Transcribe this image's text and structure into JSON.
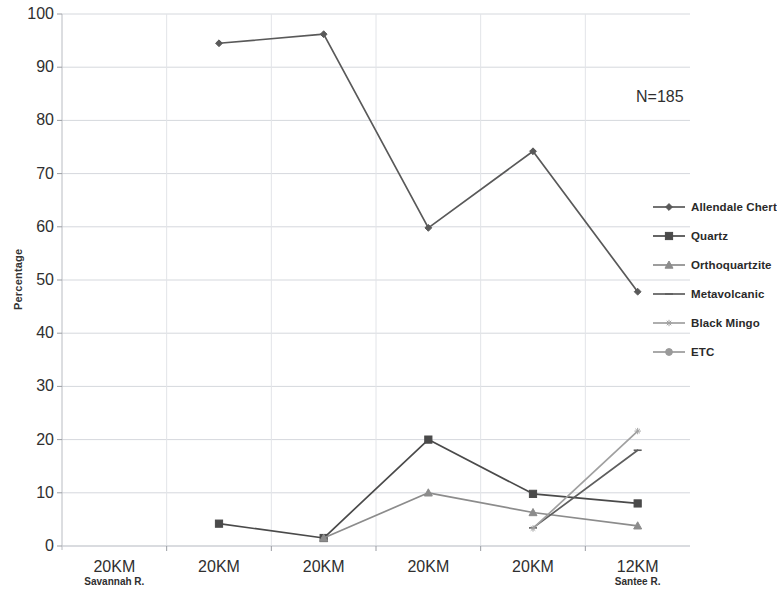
{
  "chart_data": {
    "type": "line",
    "title": "",
    "xlabel": "",
    "ylabel": "Percentage",
    "ylim": [
      0,
      100
    ],
    "ytick_step": 10,
    "yticks": [
      "100",
      "90",
      "80",
      "70",
      "60",
      "50",
      "40",
      "30",
      "20",
      "10",
      "0"
    ],
    "grid": true,
    "legend_position": "right",
    "annotation": "N=185",
    "categories": [
      "20KM",
      "20KM",
      "20KM",
      "20KM",
      "20KM",
      "12KM"
    ],
    "category_sublabels": [
      "Savannah R.",
      "",
      "",
      "",
      "",
      "Santee R."
    ],
    "series": [
      {
        "name": "Allendale Chert",
        "marker": "diamond",
        "color": "#595959",
        "values": [
          null,
          94.5,
          96.2,
          59.8,
          74.2,
          47.8
        ]
      },
      {
        "name": "Quartz",
        "marker": "square",
        "color": "#4a4a4a",
        "values": [
          null,
          4.2,
          1.5,
          20.0,
          9.8,
          8.0
        ]
      },
      {
        "name": "Orthoquartzite",
        "marker": "triangle",
        "color": "#8c8c8c",
        "values": [
          null,
          null,
          1.5,
          10.0,
          6.3,
          3.8
        ]
      },
      {
        "name": "Metavolcanic",
        "marker": "dash",
        "color": "#5e5e5e",
        "values": [
          null,
          null,
          null,
          null,
          3.4,
          18.0
        ]
      },
      {
        "name": "Black Mingo",
        "marker": "asterisk",
        "color": "#a0a0a0",
        "values": [
          null,
          null,
          null,
          null,
          3.3,
          21.6
        ]
      },
      {
        "name": "ETC",
        "marker": "circle",
        "color": "#9a9a9a",
        "values": [
          null,
          null,
          null,
          null,
          null,
          null
        ]
      }
    ]
  },
  "legend": {
    "items": [
      {
        "label": "Allendale Chert"
      },
      {
        "label": "Quartz"
      },
      {
        "label": "Orthoquartzite"
      },
      {
        "label": "Metavolcanic"
      },
      {
        "label": "Black Mingo"
      },
      {
        "label": "ETC"
      }
    ]
  }
}
